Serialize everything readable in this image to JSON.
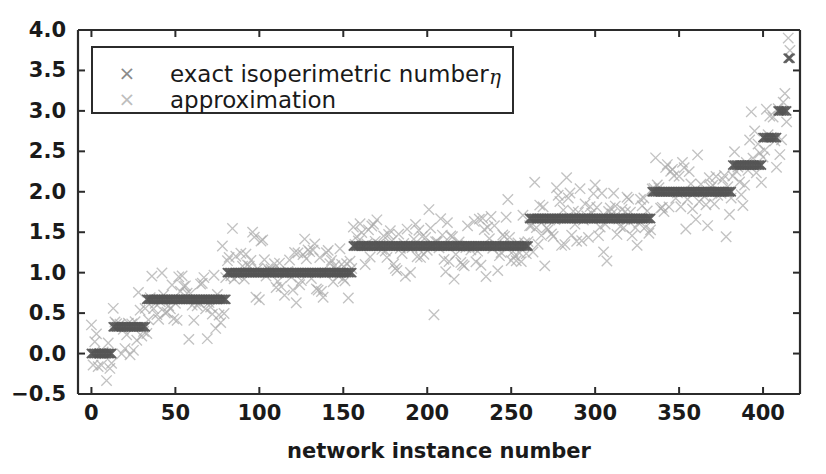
{
  "chart_data": {
    "type": "scatter",
    "title": "",
    "xlabel": "network instance number",
    "ylabel": "",
    "xlim": [
      -8,
      422
    ],
    "ylim": [
      -0.5,
      4.0
    ],
    "grid": false,
    "legend_position": "upper left",
    "xticks": [
      0,
      50,
      100,
      150,
      200,
      250,
      300,
      350,
      400
    ],
    "xticklabels": [
      "0",
      "50",
      "100",
      "150",
      "200",
      "250",
      "300",
      "350",
      "400"
    ],
    "yticks": [
      -0.5,
      0.0,
      0.5,
      1.0,
      1.5,
      2.0,
      2.5,
      3.0,
      3.5,
      4.0
    ],
    "yticklabels": [
      "-0.5",
      "0.0",
      "0.5",
      "1.0",
      "1.5",
      "2.0",
      "2.5",
      "3.0",
      "3.5",
      "4.0"
    ],
    "marker": "x",
    "series": [
      {
        "name": "exact isoperimetric number η",
        "color": "#555555",
        "marker": "x",
        "description": "step-wise plateaus of the exact isoperimetric number, sorted increasing",
        "plateaus": [
          {
            "x_start": 0,
            "x_end": 12,
            "y": 0.0
          },
          {
            "x_start": 13,
            "x_end": 32,
            "y": 0.33
          },
          {
            "x_start": 33,
            "x_end": 80,
            "y": 0.67
          },
          {
            "x_start": 81,
            "x_end": 155,
            "y": 1.0
          },
          {
            "x_start": 156,
            "x_end": 205,
            "y": 1.33
          },
          {
            "x_start": 206,
            "x_end": 260,
            "y": 1.33
          },
          {
            "x_start": 261,
            "x_end": 333,
            "y": 1.67
          },
          {
            "x_start": 334,
            "x_end": 358,
            "y": 2.0
          },
          {
            "x_start": 359,
            "x_end": 381,
            "y": 2.0
          },
          {
            "x_start": 382,
            "x_end": 399,
            "y": 2.33
          },
          {
            "x_start": 400,
            "x_end": 408,
            "y": 2.67
          },
          {
            "x_start": 409,
            "x_end": 414,
            "y": 3.0
          },
          {
            "x_start": 415,
            "x_end": 416,
            "y": 3.65
          }
        ]
      },
      {
        "name": "approximation",
        "color": "#aaaaaa",
        "marker": "x",
        "description": "approximation values scattered around the exact plateau values with spread roughly +/-0.35",
        "noise_spread": 0.35
      }
    ],
    "annotations": []
  },
  "legend": {
    "entries": [
      {
        "label": "exact isoperimetric number ",
        "symbol": "×",
        "eta": "η",
        "color": "#8a8a8a"
      },
      {
        "label": "approximation",
        "symbol": "×",
        "eta": "",
        "color": "#bdbdbd"
      }
    ]
  },
  "axes": {
    "xlabel": "network instance number",
    "spine_color": "#2b2b2b"
  },
  "colors": {
    "exact": "#555555",
    "approximation": "#aaaaaa",
    "axis": "#2b2b2b",
    "background": "#ffffff"
  }
}
